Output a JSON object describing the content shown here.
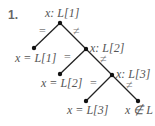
{
  "problem_number": "1.",
  "tree": {
    "nodes": [
      {
        "id": "n1",
        "label": "x: L[1]",
        "x": 60,
        "y": 23
      },
      {
        "id": "l1",
        "label": "x = L[1]",
        "x": 34,
        "y": 48
      },
      {
        "id": "n2",
        "label": "x: L[2]",
        "x": 86,
        "y": 49
      },
      {
        "id": "l2",
        "label": "x = L[2]",
        "x": 60,
        "y": 74
      },
      {
        "id": "n3",
        "label": "x: L[3]",
        "x": 112,
        "y": 75
      },
      {
        "id": "l3",
        "label": "x = L[3]",
        "x": 86,
        "y": 101
      },
      {
        "id": "l4",
        "label": "x ∉ L",
        "x": 138,
        "y": 101
      }
    ],
    "edges": [
      {
        "from": "n1",
        "to": "l1",
        "label": "="
      },
      {
        "from": "n1",
        "to": "n2",
        "label": "≠"
      },
      {
        "from": "n2",
        "to": "l2",
        "label": "="
      },
      {
        "from": "n2",
        "to": "n3",
        "label": "≠"
      },
      {
        "from": "n3",
        "to": "l3",
        "label": "="
      },
      {
        "from": "n3",
        "to": "l4",
        "label": "≠"
      }
    ]
  }
}
